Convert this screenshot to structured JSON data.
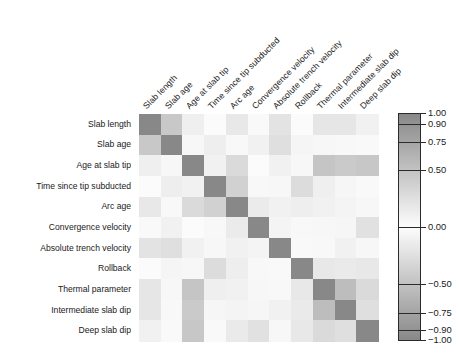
{
  "chart_data": {
    "type": "heatmap",
    "title": "",
    "xlabel": "",
    "ylabel": "",
    "grid": false,
    "legend_position": "right",
    "colormap": "grayscale",
    "colorbar": {
      "label": "",
      "min": -1.0,
      "max": 1.0,
      "ticks": [
        "1.00",
        "0.90",
        "0.75",
        "0.50",
        "0.00",
        "-0.50",
        "-0.75",
        "-0.90",
        "-1.00"
      ],
      "tick_values": [
        1.0,
        0.9,
        0.75,
        0.5,
        0.0,
        -0.5,
        -0.75,
        -0.9,
        -1.0
      ]
    },
    "categories": [
      "Slab length",
      "Slab age",
      "Age at slab tip",
      "Time since tip subducted",
      "Arc age",
      "Convergence velocity",
      "Absolute trench velocity",
      "Rollback",
      "Thermal parameter",
      "Intermediate slab dip",
      "Deep slab dip"
    ],
    "x_tick_labels": [
      "Slab length",
      "Slab age",
      "Age at slab tip",
      "Time since tip subducted",
      "Arc age",
      "Convergence velocity",
      "Absolute trench velocity",
      "Rollback",
      "Thermal parameter",
      "Intermediate slab dip",
      "Deep slab dip"
    ],
    "y_tick_labels": [
      "Slab length",
      "Slab age",
      "Age at slab tip",
      "Time since tip subducted",
      "Arc age",
      "Convergence velocity",
      "Absolute trench velocity",
      "Rollback",
      "Thermal parameter",
      "Intermediate slab dip",
      "Deep slab dip"
    ],
    "matrix": [
      [
        1.0,
        0.45,
        0.12,
        0.02,
        0.18,
        0.03,
        0.22,
        0.02,
        0.2,
        0.2,
        0.1
      ],
      [
        0.45,
        1.0,
        0.05,
        0.13,
        0.04,
        0.1,
        0.26,
        0.07,
        0.05,
        0.04,
        0.03
      ],
      [
        0.12,
        0.05,
        1.0,
        0.1,
        0.3,
        0.02,
        0.1,
        0.05,
        0.48,
        0.44,
        0.46
      ],
      [
        0.02,
        0.13,
        0.1,
        1.0,
        0.38,
        0.04,
        0.05,
        0.28,
        0.12,
        0.06,
        0.03
      ],
      [
        0.18,
        0.04,
        0.3,
        0.38,
        1.0,
        0.15,
        0.1,
        0.13,
        0.1,
        0.08,
        0.05
      ],
      [
        0.03,
        0.1,
        0.02,
        0.04,
        0.15,
        1.0,
        0.08,
        0.04,
        0.05,
        0.06,
        0.24
      ],
      [
        0.22,
        0.26,
        0.1,
        0.05,
        0.1,
        0.08,
        1.0,
        0.03,
        0.04,
        0.1,
        0.05
      ],
      [
        0.02,
        0.07,
        0.05,
        0.28,
        0.13,
        0.04,
        0.03,
        1.0,
        0.18,
        0.16,
        0.18
      ],
      [
        0.2,
        0.05,
        0.48,
        0.12,
        0.1,
        0.05,
        0.04,
        0.18,
        1.0,
        0.55,
        0.3
      ],
      [
        0.2,
        0.04,
        0.44,
        0.06,
        0.08,
        0.06,
        0.1,
        0.16,
        0.55,
        1.0,
        0.26
      ],
      [
        0.1,
        0.03,
        0.46,
        0.03,
        0.16,
        0.24,
        0.05,
        0.18,
        0.3,
        0.26,
        1.0
      ]
    ]
  }
}
